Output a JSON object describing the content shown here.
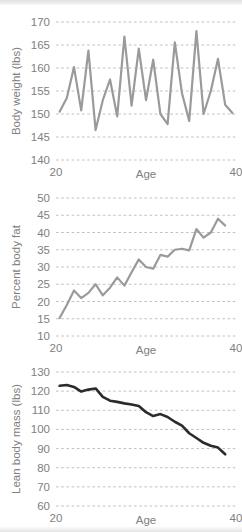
{
  "figure": {
    "background_color": "#ffffff",
    "panel_count": 3
  },
  "chart_data": [
    {
      "id": "body-weight",
      "type": "line",
      "title": "",
      "xlabel": "Age",
      "ylabel": "Body weight (lbs)",
      "xlim": [
        20,
        40
      ],
      "ylim": [
        140,
        170
      ],
      "xticks": [
        20,
        40
      ],
      "xtick_labels": [
        "20",
        "40"
      ],
      "yticks": [
        140,
        145,
        150,
        155,
        160,
        165,
        170
      ],
      "ytick_labels": [
        "140",
        "145",
        "150",
        "155",
        "160",
        "165",
        "170"
      ],
      "grid": true,
      "legend": "none",
      "line_color": "#9a9a9a",
      "line_width": 2.2,
      "x": [
        20.4,
        21.2,
        22.0,
        22.8,
        23.6,
        24.4,
        25.2,
        26.0,
        26.8,
        27.6,
        28.4,
        29.2,
        30.0,
        30.8,
        31.6,
        32.4,
        33.2,
        34.0,
        34.8,
        35.6,
        36.4,
        37.2,
        38.0,
        38.8,
        39.6
      ],
      "values": [
        150.5,
        153.5,
        160.2,
        150.8,
        163.8,
        146.5,
        153.0,
        157.5,
        149.5,
        166.8,
        151.8,
        164.2,
        153.0,
        161.8,
        150.0,
        147.8,
        165.6,
        154.5,
        148.5,
        168.0,
        150.0,
        155.0,
        162.0,
        152.0,
        150.2
      ]
    },
    {
      "id": "percent-body-fat",
      "type": "line",
      "title": "",
      "xlabel": "Age",
      "ylabel": "Percent body fat",
      "xlim": [
        20,
        40
      ],
      "ylim": [
        10,
        50
      ],
      "xticks": [
        20,
        40
      ],
      "xtick_labels": [
        "20",
        "40"
      ],
      "yticks": [
        10,
        15,
        20,
        25,
        30,
        35,
        40,
        45,
        50
      ],
      "ytick_labels": [
        "10",
        "15",
        "20",
        "25",
        "30",
        "35",
        "40",
        "45",
        "50"
      ],
      "grid": true,
      "legend": "none",
      "line_color": "#9a9a9a",
      "line_width": 2.2,
      "x": [
        20.4,
        21.2,
        22.0,
        22.8,
        23.6,
        24.4,
        25.2,
        26.0,
        26.8,
        27.6,
        28.4,
        29.2,
        30.0,
        30.8,
        31.6,
        32.4,
        33.2,
        34.0,
        34.8,
        35.6,
        36.4,
        37.2,
        38.0,
        38.8
      ],
      "values": [
        15.2,
        19.0,
        23.2,
        21.0,
        22.5,
        25.0,
        21.8,
        24.0,
        27.0,
        24.6,
        28.5,
        32.2,
        30.0,
        29.5,
        33.5,
        33.0,
        35.0,
        35.3,
        34.8,
        41.0,
        38.5,
        40.0,
        44.0,
        42.0
      ]
    },
    {
      "id": "lean-body-mass",
      "type": "line",
      "title": "",
      "xlabel": "Age",
      "ylabel": "Lean body mass (lbs)",
      "xlim": [
        20,
        40
      ],
      "ylim": [
        60,
        130
      ],
      "xticks": [
        20,
        40
      ],
      "xtick_labels": [
        "20",
        "40"
      ],
      "yticks": [
        60,
        70,
        80,
        90,
        100,
        110,
        120,
        130
      ],
      "ytick_labels": [
        "60",
        "70",
        "80",
        "90",
        "100",
        "110",
        "120",
        "130"
      ],
      "grid": true,
      "legend": "none",
      "line_color": "#2b2b2b",
      "line_width": 2.6,
      "x": [
        20.4,
        21.2,
        22.0,
        22.8,
        23.6,
        24.4,
        25.2,
        26.0,
        26.8,
        27.6,
        28.4,
        29.2,
        30.0,
        30.8,
        31.6,
        32.4,
        33.2,
        34.0,
        34.8,
        35.6,
        36.4,
        37.2,
        38.0,
        38.8
      ],
      "values": [
        122.8,
        123.2,
        122.2,
        119.8,
        120.8,
        121.4,
        117.0,
        115.0,
        114.4,
        113.6,
        113.0,
        112.2,
        109.0,
        107.0,
        108.0,
        106.5,
        104.0,
        102.0,
        98.0,
        95.5,
        93.0,
        91.5,
        90.5,
        87.0
      ]
    }
  ]
}
